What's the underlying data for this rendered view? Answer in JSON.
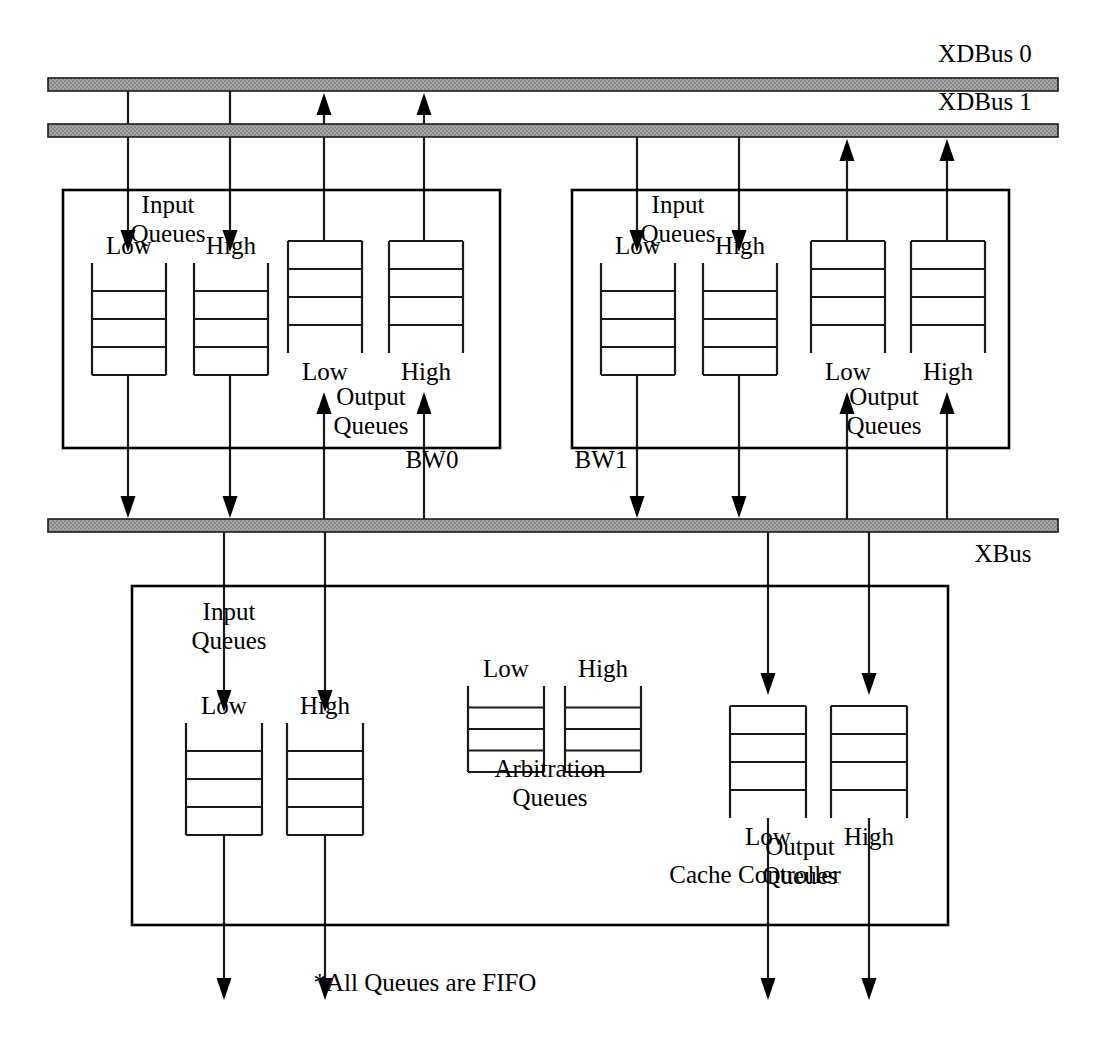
{
  "diagram": {
    "footnote": "*All Queues are FIFO",
    "colors": {
      "bus_fill": "#9c9c9c",
      "line": "#1a1a1a",
      "text": "#000000",
      "background": "#ffffff"
    },
    "buses": [
      {
        "id": "xdbus0",
        "label": "XDBus 0",
        "x": 48,
        "y": 78,
        "width": 1010,
        "height": 13,
        "label_x": 985,
        "label_y": 62,
        "label_anchor": "middle"
      },
      {
        "id": "xdbus1",
        "label": "XDBus 1",
        "x": 48,
        "y": 124,
        "width": 1010,
        "height": 13,
        "label_x": 985,
        "label_y": 110,
        "label_anchor": "middle"
      },
      {
        "id": "xbus",
        "label": "XBus",
        "x": 48,
        "y": 519,
        "width": 1010,
        "height": 13,
        "label_x": 1003,
        "label_y": 562,
        "label_anchor": "middle"
      }
    ],
    "blocks": [
      {
        "id": "bw0",
        "label": "BW0",
        "x": 63,
        "y": 190,
        "width": 437,
        "height": 258,
        "label_x": 432,
        "label_y": 468,
        "label_anchor": "middle",
        "captions": [
          {
            "id": "bw0-input-caption",
            "line1": "Input",
            "line2": "Queues",
            "x": 168,
            "y": 213
          },
          {
            "id": "bw0-output-caption",
            "line1": "Output",
            "line2": "Queues",
            "x": 371,
            "y": 405
          }
        ],
        "queues": [
          {
            "id": "bw0-in-low",
            "label": "Low",
            "label_pos": "above",
            "x": 92,
            "y": 263,
            "width": 74,
            "height": 112,
            "dividers": 3
          },
          {
            "id": "bw0-in-high",
            "label": "High",
            "label_pos": "above",
            "x": 194,
            "y": 263,
            "width": 74,
            "height": 112,
            "dividers": 3
          },
          {
            "id": "bw0-out-low",
            "label": "Low",
            "label_pos": "below",
            "x": 288,
            "y": 241,
            "width": 74,
            "height": 112,
            "dividers": 3
          },
          {
            "id": "bw0-out-high",
            "label": "High",
            "label_pos": "below",
            "x": 389,
            "y": 241,
            "width": 74,
            "height": 112,
            "dividers": 3
          }
        ]
      },
      {
        "id": "bw1",
        "label": "BW1",
        "x": 572,
        "y": 190,
        "width": 437,
        "height": 258,
        "label_x": 601,
        "label_y": 468,
        "label_anchor": "middle",
        "captions": [
          {
            "id": "bw1-input-caption",
            "line1": "Input",
            "line2": "Queues",
            "x": 678,
            "y": 213
          },
          {
            "id": "bw1-output-caption",
            "line1": "Output",
            "line2": "Queues",
            "x": 884,
            "y": 405
          }
        ],
        "queues": [
          {
            "id": "bw1-in-low",
            "label": "Low",
            "label_pos": "above",
            "x": 601,
            "y": 263,
            "width": 74,
            "height": 112,
            "dividers": 3
          },
          {
            "id": "bw1-in-high",
            "label": "High",
            "label_pos": "above",
            "x": 703,
            "y": 263,
            "width": 74,
            "height": 112,
            "dividers": 3
          },
          {
            "id": "bw1-out-low",
            "label": "Low",
            "label_pos": "below",
            "x": 811,
            "y": 241,
            "width": 74,
            "height": 112,
            "dividers": 3
          },
          {
            "id": "bw1-out-high",
            "label": "High",
            "label_pos": "below",
            "x": 911,
            "y": 241,
            "width": 74,
            "height": 112,
            "dividers": 3
          }
        ]
      },
      {
        "id": "cache-controller",
        "label": "Cache Controller",
        "x": 132,
        "y": 586,
        "width": 816,
        "height": 339,
        "label_x": 755,
        "label_y": 883,
        "label_anchor": "middle",
        "captions": [
          {
            "id": "cc-input-caption",
            "line1": "Input",
            "line2": "Queues",
            "x": 229,
            "y": 620
          },
          {
            "id": "cc-arbitration-caption",
            "line1": "Arbitration",
            "line2": "Queues",
            "x": 550,
            "y": 777
          },
          {
            "id": "cc-output-caption",
            "line1": "Output",
            "line2": "Queues",
            "x": 800,
            "y": 855
          }
        ],
        "queues": [
          {
            "id": "cc-in-low",
            "label": "Low",
            "label_pos": "above",
            "x": 186,
            "y": 723,
            "width": 76,
            "height": 112,
            "dividers": 3
          },
          {
            "id": "cc-in-high",
            "label": "High",
            "label_pos": "above",
            "x": 287,
            "y": 723,
            "width": 76,
            "height": 112,
            "dividers": 3
          },
          {
            "id": "cc-arb-low",
            "label": "Low",
            "label_pos": "above",
            "x": 468,
            "y": 686,
            "width": 76,
            "height": 86,
            "dividers": 3
          },
          {
            "id": "cc-arb-high",
            "label": "High",
            "label_pos": "above",
            "x": 565,
            "y": 686,
            "width": 76,
            "height": 86,
            "dividers": 3
          },
          {
            "id": "cc-out-low",
            "label": "Low",
            "label_pos": "below",
            "x": 730,
            "y": 706,
            "width": 76,
            "height": 112,
            "dividers": 3
          },
          {
            "id": "cc-out-high",
            "label": "High",
            "label_pos": "below",
            "x": 831,
            "y": 706,
            "width": 76,
            "height": 112,
            "dividers": 3
          }
        ]
      }
    ],
    "connections": [
      {
        "id": "xdbus0-to-bw0-low",
        "x1": 128,
        "y1": 91,
        "x2": 128,
        "y2": 252,
        "arrow": "end"
      },
      {
        "id": "xdbus0-to-bw0-high",
        "x1": 230,
        "y1": 91,
        "x2": 230,
        "y2": 252,
        "arrow": "end"
      },
      {
        "id": "bw0-out-low-to-xdbus0",
        "x1": 324,
        "y1": 241,
        "x2": 324,
        "y2": 93,
        "arrow": "end"
      },
      {
        "id": "bw0-out-high-to-xdbus0",
        "x1": 424,
        "y1": 241,
        "x2": 424,
        "y2": 93,
        "arrow": "end"
      },
      {
        "id": "bw0-in-low-to-xbus",
        "x1": 128,
        "y1": 375,
        "x2": 128,
        "y2": 518,
        "arrow": "end"
      },
      {
        "id": "bw0-in-high-to-xbus",
        "x1": 230,
        "y1": 375,
        "x2": 230,
        "y2": 518,
        "arrow": "end"
      },
      {
        "id": "xbus-to-bw0-out-low",
        "x1": 324,
        "y1": 519,
        "x2": 324,
        "y2": 392,
        "arrow": "end"
      },
      {
        "id": "xbus-to-bw0-out-high",
        "x1": 424,
        "y1": 519,
        "x2": 424,
        "y2": 392,
        "arrow": "end"
      },
      {
        "id": "xdbus1-to-bw1-low",
        "x1": 637,
        "y1": 137,
        "x2": 637,
        "y2": 252,
        "arrow": "end"
      },
      {
        "id": "xdbus1-to-bw1-high",
        "x1": 739,
        "y1": 137,
        "x2": 739,
        "y2": 252,
        "arrow": "end"
      },
      {
        "id": "bw1-out-low-to-xdbus1",
        "x1": 847,
        "y1": 241,
        "x2": 847,
        "y2": 139,
        "arrow": "end"
      },
      {
        "id": "bw1-out-high-to-xdbus1",
        "x1": 947,
        "y1": 241,
        "x2": 947,
        "y2": 139,
        "arrow": "end"
      },
      {
        "id": "bw1-in-low-to-xbus",
        "x1": 637,
        "y1": 375,
        "x2": 637,
        "y2": 518,
        "arrow": "end"
      },
      {
        "id": "bw1-in-high-to-xbus",
        "x1": 739,
        "y1": 375,
        "x2": 739,
        "y2": 518,
        "arrow": "end"
      },
      {
        "id": "xbus-to-bw1-out-low",
        "x1": 847,
        "y1": 519,
        "x2": 847,
        "y2": 392,
        "arrow": "end"
      },
      {
        "id": "xbus-to-bw1-out-high",
        "x1": 947,
        "y1": 519,
        "x2": 947,
        "y2": 392,
        "arrow": "end"
      },
      {
        "id": "xbus-to-cc-in-low",
        "x1": 224,
        "y1": 532,
        "x2": 224,
        "y2": 712,
        "arrow": "end"
      },
      {
        "id": "xbus-to-cc-in-high",
        "x1": 325,
        "y1": 532,
        "x2": 325,
        "y2": 712,
        "arrow": "end"
      },
      {
        "id": "xbus-to-cc-out-low",
        "x1": 768,
        "y1": 532,
        "x2": 768,
        "y2": 695,
        "arrow": "end"
      },
      {
        "id": "xbus-to-cc-out-high",
        "x1": 869,
        "y1": 532,
        "x2": 869,
        "y2": 695,
        "arrow": "end"
      },
      {
        "id": "cc-in-low-down",
        "x1": 224,
        "y1": 835,
        "x2": 224,
        "y2": 1000,
        "arrow": "end"
      },
      {
        "id": "cc-in-high-down",
        "x1": 325,
        "y1": 835,
        "x2": 325,
        "y2": 1000,
        "arrow": "end"
      },
      {
        "id": "cc-out-low-down",
        "x1": 768,
        "y1": 818,
        "x2": 768,
        "y2": 1000,
        "arrow": "end"
      },
      {
        "id": "cc-out-high-down",
        "x1": 869,
        "y1": 818,
        "x2": 869,
        "y2": 1000,
        "arrow": "end"
      }
    ],
    "footnote_position": {
      "x": 425,
      "y": 991
    }
  }
}
